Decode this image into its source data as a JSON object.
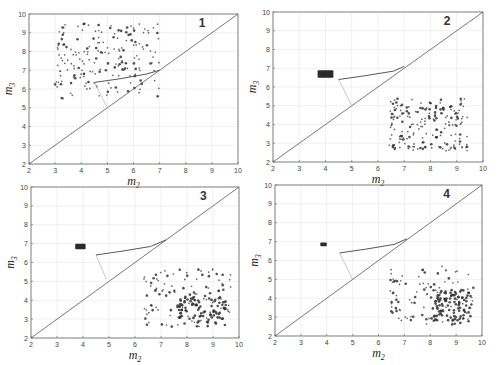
{
  "chart_data": [
    {
      "type": "scatter",
      "panel": "1",
      "title": "1",
      "xlabel": "m2",
      "ylabel": "m3",
      "xlim": [
        2,
        10
      ],
      "ylim": [
        2,
        10
      ],
      "xticks": [
        2,
        3,
        4,
        5,
        6,
        7,
        8,
        9,
        10
      ],
      "yticks": [
        2,
        3,
        4,
        5,
        6,
        7,
        8,
        9,
        10
      ],
      "grid": true,
      "diagonal": [
        [
          2,
          2
        ],
        [
          10,
          10
        ]
      ],
      "dark_path": [
        [
          4.5,
          6.35
        ],
        [
          5.5,
          6.55
        ],
        [
          6.5,
          6.8
        ],
        [
          7.0,
          7.0
        ]
      ],
      "light_path": [
        [
          4.5,
          6.35
        ],
        [
          5.0,
          5.0
        ]
      ],
      "point_cloud": {
        "x_range": [
          3.0,
          7.0
        ],
        "y_range": [
          5.5,
          9.5
        ],
        "count": 190,
        "seed": 11,
        "dense_region": null
      },
      "cluster": null,
      "pixel_box": {
        "left": 29,
        "top": 14,
        "right": 238,
        "bottom": 164
      }
    },
    {
      "type": "scatter",
      "panel": "2",
      "title": "2",
      "xlabel": "m2",
      "ylabel": "m3",
      "xlim": [
        2,
        10
      ],
      "ylim": [
        2,
        10
      ],
      "xticks": [
        2,
        3,
        4,
        5,
        6,
        7,
        8,
        9,
        10
      ],
      "yticks": [
        2,
        3,
        4,
        5,
        6,
        7,
        8,
        9,
        10
      ],
      "grid": true,
      "diagonal": [
        [
          2,
          2
        ],
        [
          10,
          10
        ]
      ],
      "dark_path": [
        [
          4.5,
          6.4
        ],
        [
          5.5,
          6.6
        ],
        [
          6.6,
          6.85
        ],
        [
          7.0,
          7.1
        ]
      ],
      "light_path": [
        [
          4.5,
          6.4
        ],
        [
          5.0,
          5.0
        ]
      ],
      "point_cloud": {
        "x_range": [
          6.4,
          9.4
        ],
        "y_range": [
          2.6,
          5.4
        ],
        "count": 190,
        "seed": 23,
        "dense_region": null
      },
      "cluster": {
        "x_range": [
          3.7,
          4.3
        ],
        "y_range": [
          6.5,
          6.9
        ]
      },
      "pixel_box": {
        "left": 273,
        "top": 12,
        "right": 483,
        "bottom": 162
      }
    },
    {
      "type": "scatter",
      "panel": "3",
      "title": "3",
      "xlabel": "m2",
      "ylabel": "m3",
      "xlim": [
        2,
        10
      ],
      "ylim": [
        2,
        10
      ],
      "xticks": [
        2,
        3,
        4,
        5,
        6,
        7,
        8,
        9,
        10
      ],
      "yticks": [
        2,
        3,
        4,
        5,
        6,
        7,
        8,
        9,
        10
      ],
      "grid": true,
      "diagonal": [
        [
          2,
          2
        ],
        [
          10,
          10
        ]
      ],
      "dark_path": [
        [
          4.5,
          6.4
        ],
        [
          5.5,
          6.6
        ],
        [
          6.6,
          6.85
        ],
        [
          7.2,
          7.2
        ]
      ],
      "light_path": [
        [
          4.5,
          6.4
        ],
        [
          4.9,
          5.1
        ]
      ],
      "point_cloud": {
        "x_range": [
          6.3,
          9.7
        ],
        "y_range": [
          2.6,
          5.7
        ],
        "count": 200,
        "seed": 37,
        "dense_region": {
          "x_range": [
            7.6,
            9.5
          ],
          "y_range": [
            2.6,
            4.3
          ]
        }
      },
      "cluster": {
        "x_range": [
          3.7,
          4.1
        ],
        "y_range": [
          6.7,
          7.0
        ]
      },
      "pixel_box": {
        "left": 31,
        "top": 187,
        "right": 239,
        "bottom": 338
      }
    },
    {
      "type": "scatter",
      "panel": "4",
      "title": "4",
      "xlabel": "m2",
      "ylabel": "m3",
      "xlim": [
        2,
        10
      ],
      "ylim": [
        2,
        10
      ],
      "xticks": [
        2,
        3,
        4,
        5,
        6,
        7,
        8,
        9,
        10
      ],
      "yticks": [
        2,
        3,
        4,
        5,
        6,
        7,
        8,
        9,
        10
      ],
      "grid": true,
      "diagonal": [
        [
          2,
          2
        ],
        [
          10,
          10
        ]
      ],
      "dark_path": [
        [
          4.5,
          6.4
        ],
        [
          5.5,
          6.6
        ],
        [
          6.6,
          6.85
        ],
        [
          7.1,
          7.15
        ]
      ],
      "light_path": [
        [
          4.5,
          6.4
        ],
        [
          5.0,
          5.0
        ]
      ],
      "point_cloud": {
        "x_range": [
          6.4,
          9.7
        ],
        "y_range": [
          2.6,
          5.7
        ],
        "count": 200,
        "seed": 53,
        "dense_region": {
          "x_range": [
            8.0,
            9.6
          ],
          "y_range": [
            2.6,
            4.5
          ]
        }
      },
      "cluster": {
        "x_range": [
          3.75,
          4.0
        ],
        "y_range": [
          6.75,
          6.95
        ]
      },
      "pixel_box": {
        "left": 275,
        "top": 185,
        "right": 482,
        "bottom": 336
      }
    }
  ],
  "colors": {
    "axis": "#666666",
    "grid": "#e6e6e6",
    "diagonal": "#555555",
    "dark_path": "#444444",
    "light_path": "#bbbbbb",
    "points": "#333333",
    "cluster": "#2a2a2a"
  }
}
